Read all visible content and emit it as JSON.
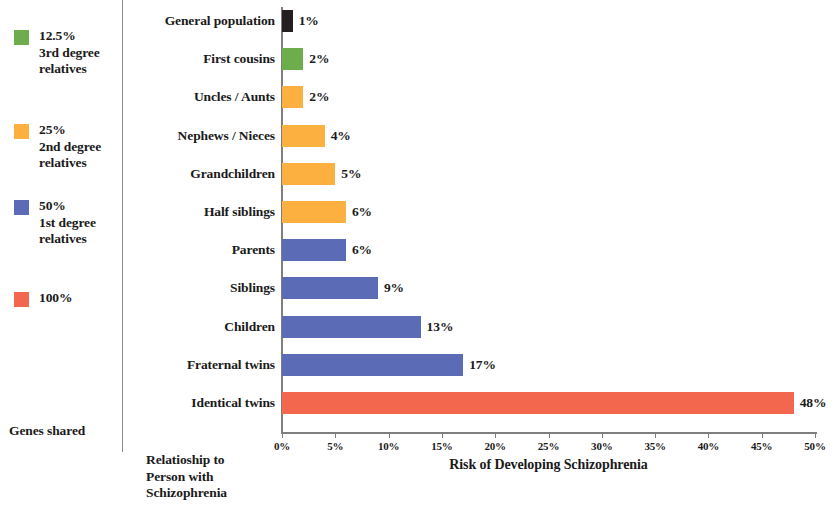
{
  "legend": {
    "entries": [
      {
        "swatch_color": "#6DAD4B",
        "swatch_name": "legend-swatch-green",
        "lines": [
          "12.5%",
          "3rd degree",
          "relatives"
        ]
      },
      {
        "swatch_color": "#FBB040",
        "swatch_name": "legend-swatch-orange",
        "lines": [
          "25%",
          "2nd degree",
          "relatives"
        ]
      },
      {
        "swatch_color": "#5B6BB5",
        "swatch_name": "legend-swatch-blue",
        "lines": [
          "50%",
          "1st degree",
          "relatives"
        ]
      },
      {
        "swatch_color": "#F4674F",
        "swatch_name": "legend-swatch-red",
        "lines": [
          "100%"
        ]
      }
    ],
    "title": "Genes shared"
  },
  "chart_data": {
    "type": "bar",
    "orientation": "horizontal",
    "title": "",
    "xlabel": "Risk of Developing Schizophrenia",
    "ylabel": "Relatioship to Person with Schizophrenia",
    "ylabel_lines": [
      "Relatioship to",
      "Person with",
      "Schizophrenia"
    ],
    "xlim": [
      0,
      50
    ],
    "xticks": [
      0,
      5,
      10,
      15,
      20,
      25,
      30,
      35,
      40,
      45,
      50
    ],
    "xtick_labels": [
      "0%",
      "5%",
      "10%",
      "15%",
      "20%",
      "25%",
      "30%",
      "35%",
      "40%",
      "45%",
      "50%"
    ],
    "grid": false,
    "legend_position": "left",
    "categories": [
      "General population",
      "First cousins",
      "Uncles / Aunts",
      "Nephews / Nieces",
      "Grandchildren",
      "Half siblings",
      "Parents",
      "Siblings",
      "Children",
      "Fraternal twins",
      "Identical twins"
    ],
    "values": [
      1,
      2,
      2,
      4,
      5,
      6,
      6,
      9,
      13,
      17,
      48
    ],
    "value_labels": [
      "1%",
      "2%",
      "2%",
      "4%",
      "5%",
      "6%",
      "6%",
      "9%",
      "13%",
      "17%",
      "48%"
    ],
    "bar_colors": [
      "#231F20",
      "#6DAD4B",
      "#FBB040",
      "#FBB040",
      "#FBB040",
      "#FBB040",
      "#5B6BB5",
      "#5B6BB5",
      "#5B6BB5",
      "#5B6BB5",
      "#F4674F"
    ]
  }
}
